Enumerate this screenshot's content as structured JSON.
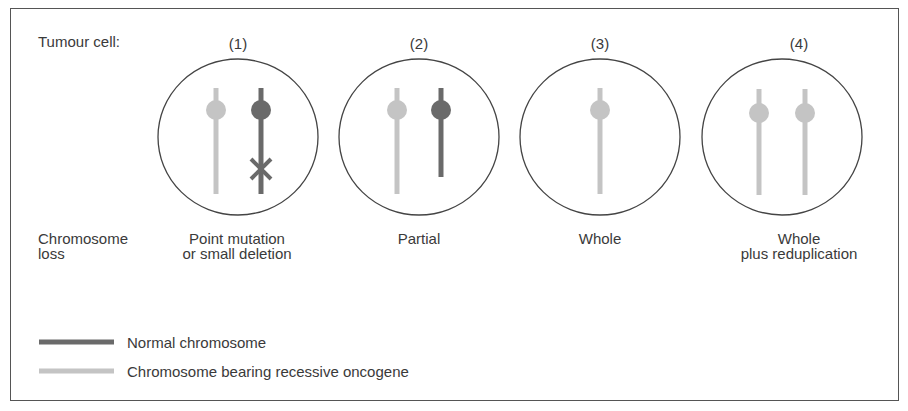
{
  "figure": {
    "row_label": "Tumour cell:",
    "mechanism_label_line1": "Chromosome",
    "mechanism_label_line2": "loss",
    "cells": [
      {
        "number": "(1)",
        "caption_line1": "Point mutation",
        "caption_line2": "or small deletion",
        "chromosomes": [
          {
            "type": "recessive",
            "length": "full"
          },
          {
            "type": "normal",
            "length": "full",
            "marker": "point-mutation-x"
          }
        ]
      },
      {
        "number": "(2)",
        "caption_line1": "Partial",
        "caption_line2": "",
        "chromosomes": [
          {
            "type": "recessive",
            "length": "full"
          },
          {
            "type": "normal",
            "length": "partial"
          }
        ]
      },
      {
        "number": "(3)",
        "caption_line1": "Whole",
        "caption_line2": "",
        "chromosomes": [
          {
            "type": "recessive",
            "length": "full"
          }
        ]
      },
      {
        "number": "(4)",
        "caption_line1": "Whole",
        "caption_line2": "plus reduplication",
        "chromosomes": [
          {
            "type": "recessive",
            "length": "full"
          },
          {
            "type": "recessive",
            "length": "full"
          }
        ]
      }
    ],
    "legend": [
      {
        "label": "Normal chromosome",
        "color": "#6a6a6a"
      },
      {
        "label": "Chromosome bearing recessive oncogene",
        "color": "#c4c4c4"
      }
    ],
    "colors": {
      "normal": "#6a6a6a",
      "recessive": "#c4c4c4",
      "outline": "#444444"
    }
  }
}
